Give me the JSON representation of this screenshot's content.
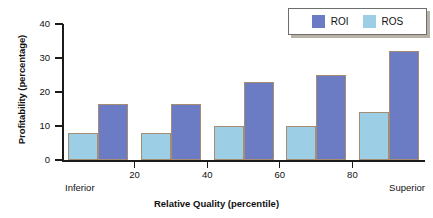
{
  "chart_data": {
    "type": "bar",
    "title": "",
    "xlabel": "Relative Quality (percentile)",
    "ylabel": "Profitability (percentage)",
    "categories": [
      "0-20",
      "20-40",
      "40-60",
      "60-80",
      "80-100"
    ],
    "x_tick_labels": [
      "20",
      "40",
      "60",
      "80"
    ],
    "x_tick_values": [
      20,
      40,
      60,
      80
    ],
    "x_edge_labels": {
      "left": "Inferior",
      "right": "Superior"
    },
    "y_tick_labels": [
      "0",
      "10",
      "20",
      "30",
      "40"
    ],
    "y_tick_values": [
      0,
      10,
      20,
      30,
      40
    ],
    "ylim": [
      0,
      40
    ],
    "grid": false,
    "legend_position": "top-right",
    "series": [
      {
        "name": "ROS",
        "color": "#9ccfe6",
        "values": [
          8,
          8,
          10,
          10,
          14
        ]
      },
      {
        "name": "ROI",
        "color": "#6b7cc4",
        "values": [
          16.5,
          16.5,
          23,
          25,
          32
        ]
      }
    ]
  },
  "legend": {
    "items": [
      {
        "label": "ROI",
        "color": "#6b7cc4"
      },
      {
        "label": "ROS",
        "color": "#9ccfe6"
      }
    ]
  },
  "colors": {
    "roi": "#6b7cc4",
    "ros": "#9ccfe6",
    "bar_outline": "#a68d72",
    "axis": "#1b1b1b",
    "background": "#ffffff"
  }
}
